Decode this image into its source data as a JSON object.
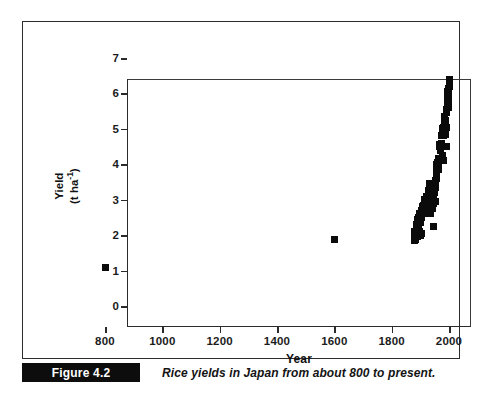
{
  "figure": {
    "number_label": "Figure 4.2",
    "caption": "Rice yields in Japan from about 800 to present."
  },
  "chart_data": {
    "type": "scatter",
    "title": "",
    "xlabel": "Year",
    "ylabel": "Yield (t ha-1)",
    "ylabel_line1": "Yield",
    "ylabel_line2_prefix": "(t ha",
    "ylabel_line2_sup": "-1",
    "ylabel_line2_suffix": ")",
    "xlim": [
      800,
      2000
    ],
    "ylim": [
      0,
      7
    ],
    "xticks": [
      800,
      1000,
      1200,
      1400,
      1600,
      1800,
      2000
    ],
    "xtick_labels": [
      "800",
      "1000",
      "1200",
      "1400",
      "1600",
      "1800",
      "2000"
    ],
    "yticks": [
      0,
      1,
      2,
      3,
      4,
      5,
      6,
      7
    ],
    "ytick_labels": [
      "0",
      "1",
      "2",
      "3",
      "4",
      "5",
      "6",
      "7"
    ],
    "grid": false,
    "legend": false,
    "marker": "square",
    "marker_color": "#0b0b0b",
    "series": [
      {
        "name": "Rice yield in Japan",
        "points": [
          [
            800,
            1.1
          ],
          [
            1600,
            1.88
          ],
          [
            1878,
            1.95
          ],
          [
            1879,
            2.1
          ],
          [
            1880,
            1.85
          ],
          [
            1881,
            2.0
          ],
          [
            1882,
            1.9
          ],
          [
            1883,
            2.05
          ],
          [
            1884,
            1.88
          ],
          [
            1885,
            2.15
          ],
          [
            1886,
            2.25
          ],
          [
            1887,
            2.3
          ],
          [
            1888,
            2.2
          ],
          [
            1889,
            1.95
          ],
          [
            1890,
            2.45
          ],
          [
            1891,
            2.2
          ],
          [
            1892,
            2.35
          ],
          [
            1893,
            2.15
          ],
          [
            1894,
            2.5
          ],
          [
            1895,
            2.3
          ],
          [
            1896,
            2.1
          ],
          [
            1897,
            2.05
          ],
          [
            1898,
            2.6
          ],
          [
            1899,
            2.35
          ],
          [
            1900,
            2.4
          ],
          [
            1901,
            2.55
          ],
          [
            1902,
            2.0
          ],
          [
            1903,
            2.5
          ],
          [
            1904,
            2.7
          ],
          [
            1905,
            2.05
          ],
          [
            1906,
            2.65
          ],
          [
            1907,
            2.6
          ],
          [
            1908,
            2.8
          ],
          [
            1909,
            2.75
          ],
          [
            1910,
            2.6
          ],
          [
            1911,
            2.85
          ],
          [
            1912,
            2.7
          ],
          [
            1913,
            2.65
          ],
          [
            1914,
            3.0
          ],
          [
            1915,
            2.95
          ],
          [
            1916,
            2.9
          ],
          [
            1917,
            2.85
          ],
          [
            1918,
            2.8
          ],
          [
            1919,
            2.95
          ],
          [
            1920,
            3.1
          ],
          [
            1921,
            2.85
          ],
          [
            1922,
            2.95
          ],
          [
            1923,
            2.9
          ],
          [
            1924,
            2.8
          ],
          [
            1925,
            3.05
          ],
          [
            1926,
            2.95
          ],
          [
            1927,
            3.1
          ],
          [
            1928,
            3.0
          ],
          [
            1929,
            2.9
          ],
          [
            1930,
            3.25
          ],
          [
            1931,
            2.8
          ],
          [
            1932,
            3.0
          ],
          [
            1933,
            3.45
          ],
          [
            1934,
            2.6
          ],
          [
            1935,
            3.05
          ],
          [
            1936,
            3.2
          ],
          [
            1937,
            3.15
          ],
          [
            1938,
            3.0
          ],
          [
            1939,
            3.3
          ],
          [
            1940,
            2.95
          ],
          [
            1941,
            2.75
          ],
          [
            1942,
            3.1
          ],
          [
            1943,
            3.0
          ],
          [
            1944,
            2.8
          ],
          [
            1945,
            2.25
          ],
          [
            1946,
            2.9
          ],
          [
            1947,
            3.05
          ],
          [
            1948,
            3.35
          ],
          [
            1949,
            3.2
          ],
          [
            1950,
            3.3
          ],
          [
            1951,
            3.25
          ],
          [
            1952,
            3.55
          ],
          [
            1953,
            2.95
          ],
          [
            1954,
            3.35
          ],
          [
            1955,
            4.0
          ],
          [
            1956,
            3.6
          ],
          [
            1957,
            3.75
          ],
          [
            1958,
            3.85
          ],
          [
            1959,
            3.95
          ],
          [
            1960,
            4.0
          ],
          [
            1961,
            4.05
          ],
          [
            1962,
            4.15
          ],
          [
            1963,
            3.85
          ],
          [
            1964,
            4.1
          ],
          [
            1965,
            4.05
          ],
          [
            1966,
            4.15
          ],
          [
            1967,
            4.55
          ],
          [
            1968,
            4.5
          ],
          [
            1969,
            4.4
          ],
          [
            1970,
            4.4
          ],
          [
            1971,
            4.15
          ],
          [
            1972,
            4.5
          ],
          [
            1973,
            4.6
          ],
          [
            1974,
            4.6
          ],
          [
            1975,
            4.8
          ],
          [
            1976,
            4.25
          ],
          [
            1977,
            4.85
          ],
          [
            1978,
            5.0
          ],
          [
            1979,
            4.95
          ],
          [
            1980,
            4.1
          ],
          [
            1981,
            4.8
          ],
          [
            1982,
            5.05
          ],
          [
            1983,
            4.85
          ],
          [
            1984,
            5.25
          ],
          [
            1985,
            5.35
          ],
          [
            1986,
            5.3
          ],
          [
            1987,
            5.25
          ],
          [
            1988,
            4.85
          ],
          [
            1989,
            5.25
          ],
          [
            1990,
            5.45
          ],
          [
            1991,
            5.05
          ],
          [
            1992,
            5.55
          ],
          [
            1993,
            4.5
          ],
          [
            1994,
            5.85
          ],
          [
            1995,
            5.7
          ],
          [
            1996,
            5.75
          ],
          [
            1997,
            5.9
          ],
          [
            1998,
            5.6
          ],
          [
            1999,
            5.8
          ],
          [
            2000,
            6.4
          ],
          [
            1996,
            6.05
          ],
          [
            1997,
            6.15
          ],
          [
            1999,
            6.1
          ],
          [
            2000,
            6.2
          ]
        ]
      }
    ]
  }
}
